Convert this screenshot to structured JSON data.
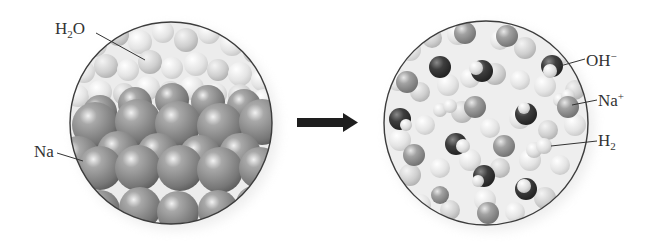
{
  "diagram": {
    "type": "reaction-schematic",
    "left_panel": {
      "name": "reactants",
      "labels": [
        {
          "id": "water",
          "base": "H",
          "sub": "2",
          "tail": "O",
          "sup": ""
        },
        {
          "id": "sodium",
          "base": "Na",
          "sub": "",
          "tail": "",
          "sup": ""
        }
      ]
    },
    "arrow": {
      "direction": "right",
      "meaning": "reacts to form"
    },
    "right_panel": {
      "name": "products",
      "labels": [
        {
          "id": "hydroxide",
          "base": "OH",
          "sub": "",
          "tail": "",
          "sup": "−"
        },
        {
          "id": "sodium-ion",
          "base": "Na",
          "sub": "",
          "tail": "",
          "sup": "+"
        },
        {
          "id": "hydrogen",
          "base": "H",
          "sub": "2",
          "tail": "",
          "sup": ""
        }
      ]
    },
    "colors": {
      "sodium_atom": "#8a8a8a",
      "water_molecule": "#e6e6e6",
      "hydroxide_oxygen": "#3a3a3a",
      "circle_outline": "#3c3c3c",
      "arrow": "#1e1e1e",
      "background": "#ffffff"
    }
  }
}
